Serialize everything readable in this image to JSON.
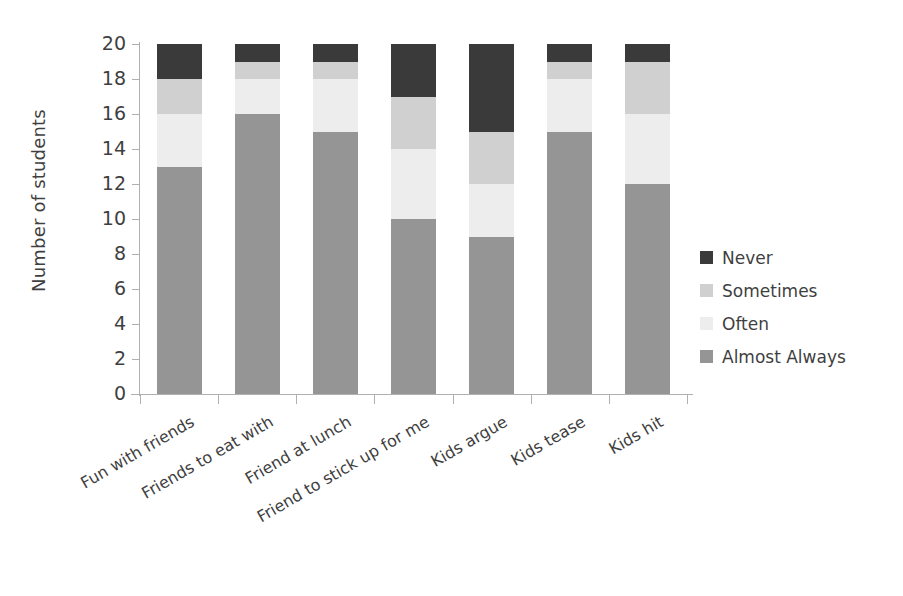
{
  "chart_data": {
    "type": "bar",
    "subtype": "stacked-bar",
    "title": "",
    "xlabel": "",
    "ylabel": "Number of students",
    "ylim": [
      0,
      20
    ],
    "ytick_step": 2,
    "yticks": [
      20,
      18,
      16,
      14,
      12,
      10,
      8,
      6,
      4,
      2,
      0
    ],
    "grid": false,
    "legend_position": "right",
    "stack_order_bottom_to_top": [
      "Almost Always",
      "Often",
      "Sometimes",
      "Never"
    ],
    "categories": [
      "Fun with friends",
      "Friends to eat with",
      "Friend at lunch",
      "Friend to stick up for me",
      "Kids argue",
      "Kids tease",
      "Kids hit"
    ],
    "series": [
      {
        "name": "Almost Always",
        "color": "#959595",
        "values": [
          13,
          16,
          15,
          10,
          9,
          15,
          12
        ]
      },
      {
        "name": "Often",
        "color": "#ededed",
        "values": [
          3,
          2,
          3,
          4,
          3,
          3,
          4
        ]
      },
      {
        "name": "Sometimes",
        "color": "#d0d0d0",
        "values": [
          2,
          1,
          1,
          3,
          3,
          1,
          3
        ]
      },
      {
        "name": "Never",
        "color": "#3a3a3a",
        "values": [
          2,
          1,
          1,
          3,
          5,
          1,
          1
        ]
      }
    ],
    "legend_entries": [
      {
        "label": "Never",
        "color": "#3a3a3a"
      },
      {
        "label": "Sometimes",
        "color": "#d0d0d0"
      },
      {
        "label": "Often",
        "color": "#ededed"
      },
      {
        "label": "Almost Always",
        "color": "#959595"
      }
    ],
    "axis_color": "#b0b0b0",
    "text_color": "#3f3f3f",
    "background": "#ffffff"
  }
}
